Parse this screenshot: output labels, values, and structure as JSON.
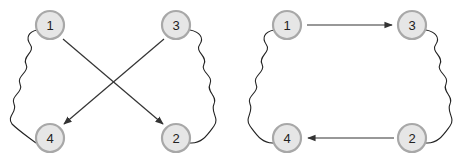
{
  "diagrams": [
    {
      "id": "left",
      "nodes": [
        {
          "label": "1",
          "x": 50,
          "y": 25
        },
        {
          "label": "3",
          "x": 176,
          "y": 25
        },
        {
          "label": "4",
          "x": 50,
          "y": 138
        },
        {
          "label": "2",
          "x": 176,
          "y": 138
        }
      ],
      "arrows": [
        {
          "from": "1",
          "to": "2"
        },
        {
          "from": "3",
          "to": "4"
        }
      ],
      "wavy_links": [
        {
          "from": "1",
          "to": "4",
          "side": "left"
        },
        {
          "from": "3",
          "to": "2",
          "side": "right"
        }
      ]
    },
    {
      "id": "right",
      "nodes": [
        {
          "label": "1",
          "x": 287,
          "y": 25
        },
        {
          "label": "3",
          "x": 412,
          "y": 25
        },
        {
          "label": "4",
          "x": 287,
          "y": 138
        },
        {
          "label": "2",
          "x": 412,
          "y": 138
        }
      ],
      "arrows": [
        {
          "from": "1",
          "to": "3"
        },
        {
          "from": "2",
          "to": "4"
        }
      ],
      "wavy_links": [
        {
          "from": "1",
          "to": "4",
          "side": "left"
        },
        {
          "from": "3",
          "to": "2",
          "side": "right"
        }
      ]
    }
  ]
}
